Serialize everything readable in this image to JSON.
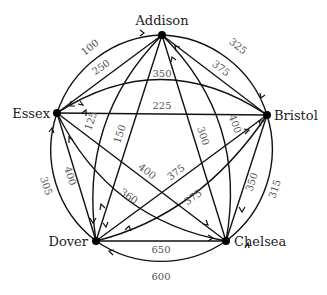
{
  "nodes": [
    {
      "id": "addison",
      "label": "Addison",
      "x": 162,
      "y": 35
    },
    {
      "id": "bristol",
      "label": "Bristol",
      "x": 267,
      "y": 115
    },
    {
      "id": "chelsea",
      "label": "Chelsea",
      "x": 226,
      "y": 241
    },
    {
      "id": "dover",
      "label": "Dover",
      "x": 96,
      "y": 241
    },
    {
      "id": "essex",
      "label": "Essex",
      "x": 57,
      "y": 113
    }
  ],
  "edges": [
    {
      "from": "essex",
      "to": "addison",
      "weight": "100",
      "kind": "outer-arc"
    },
    {
      "from": "addison",
      "to": "bristol",
      "weight": "325",
      "kind": "outer-arc"
    },
    {
      "from": "bristol",
      "to": "chelsea",
      "weight": "315",
      "kind": "outer-arc"
    },
    {
      "from": "chelsea",
      "to": "dover",
      "weight": "600",
      "kind": "outer-arc"
    },
    {
      "from": "dover",
      "to": "essex",
      "weight": "305",
      "kind": "outer-arc"
    },
    {
      "from": "addison",
      "to": "essex",
      "weight": "250",
      "kind": "straight"
    },
    {
      "from": "bristol",
      "to": "addison",
      "weight": "375",
      "kind": "straight"
    },
    {
      "from": "chelsea",
      "to": "bristol",
      "weight": "350",
      "kind": "straight"
    },
    {
      "from": "dover",
      "to": "chelsea",
      "weight": "650",
      "kind": "straight"
    },
    {
      "from": "essex",
      "to": "dover",
      "weight": "400",
      "kind": "straight"
    },
    {
      "from": "bristol",
      "to": "essex",
      "weight": "225",
      "kind": "straight"
    },
    {
      "from": "addison",
      "to": "dover",
      "weight": "150",
      "kind": "straight"
    },
    {
      "from": "chelsea",
      "to": "addison",
      "weight": "300",
      "kind": "straight"
    },
    {
      "from": "essex",
      "to": "chelsea",
      "weight": "400",
      "kind": "straight"
    },
    {
      "from": "dover",
      "to": "bristol",
      "weight": "375",
      "kind": "straight"
    },
    {
      "from": "essex",
      "to": "bristol",
      "weight": "350",
      "kind": "inner-arc"
    },
    {
      "from": "dover",
      "to": "addison",
      "weight": "125",
      "kind": "inner-arc"
    },
    {
      "from": "addison",
      "to": "chelsea",
      "weight": "400",
      "kind": "inner-arc"
    },
    {
      "from": "chelsea",
      "to": "essex",
      "weight": "360",
      "kind": "inner-arc"
    },
    {
      "from": "bristol",
      "to": "dover",
      "weight": "375",
      "kind": "inner-arc"
    }
  ],
  "labels": {
    "addison": "Addison",
    "bristol": "Bristol",
    "chelsea": "Chelsea",
    "dover": "Dover",
    "essex": "Essex"
  },
  "weights": {
    "e_add_out": "100",
    "a_bri_out": "325",
    "b_che_out": "315",
    "c_dov_out": "600",
    "d_ess_out": "305",
    "a_ess": "250",
    "b_add": "375",
    "c_bri": "350",
    "d_che": "650",
    "e_dov": "400",
    "b_ess": "225",
    "a_dov": "150",
    "c_add": "300",
    "e_che": "400",
    "d_bri": "375",
    "e_bri_arc": "350",
    "d_add_arc": "125",
    "a_che_arc": "400",
    "c_ess_arc": "360",
    "b_dov_arc": "375"
  }
}
